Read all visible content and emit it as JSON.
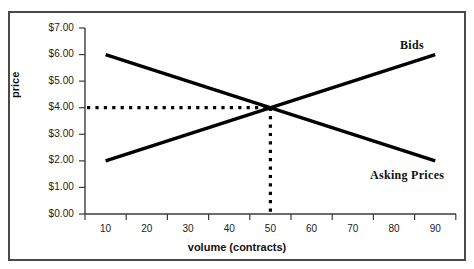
{
  "chart_data": {
    "type": "line",
    "title": "",
    "subtitle": "",
    "xlabel": "volume (contracts)",
    "ylabel": "price",
    "x": [
      10,
      20,
      30,
      40,
      50,
      60,
      70,
      80,
      90
    ],
    "xtick_labels": [
      "10",
      "20",
      "30",
      "40",
      "50",
      "60",
      "70",
      "80",
      "90"
    ],
    "ytick_labels": [
      "$7.00",
      "$6.00",
      "$5.00",
      "$4.00",
      "$3.00",
      "$2.00",
      "$1.00",
      "$0.00"
    ],
    "ytick_values": [
      7,
      6,
      5,
      4,
      3,
      2,
      1,
      0
    ],
    "ylim": [
      0,
      7
    ],
    "xlim": [
      10,
      90
    ],
    "grid": false,
    "legend_position": "inline-annotation",
    "series": [
      {
        "name": "Bids",
        "values": [
          2.0,
          2.5,
          3.0,
          3.5,
          4.0,
          4.5,
          5.0,
          5.5,
          6.0
        ],
        "color": "#000000",
        "style": "solid"
      },
      {
        "name": "Asking Prices",
        "values": [
          6.0,
          5.5,
          5.0,
          4.5,
          4.0,
          3.5,
          3.0,
          2.5,
          2.0
        ],
        "color": "#000000",
        "style": "solid"
      }
    ],
    "annotations": [
      {
        "name": "equilibrium-horizontal-guide",
        "type": "dotted-horizontal-line",
        "value": 4.0,
        "from_x": 10,
        "to_x": 50,
        "color": "#000000"
      },
      {
        "name": "equilibrium-vertical-guide",
        "type": "dotted-vertical-line",
        "value": 50,
        "from_y": 0,
        "to_y": 4.0,
        "color": "#000000"
      }
    ],
    "equilibrium_point": {
      "volume": 50,
      "price": 4.0
    }
  },
  "labels": {
    "bids": "Bids",
    "asking_prices": "Asking Prices",
    "x_axis_title": "volume (contracts)",
    "y_axis_title": "price",
    "y0": "$0.00",
    "y1": "$1.00",
    "y2": "$2.00",
    "y3": "$3.00",
    "y4": "$4.00",
    "y5": "$5.00",
    "y6": "$6.00",
    "y7": "$7.00",
    "x10": "10",
    "x20": "20",
    "x30": "30",
    "x40": "40",
    "x50": "50",
    "x60": "60",
    "x70": "70",
    "x80": "80",
    "x90": "90"
  },
  "colors": {
    "line": "#000000",
    "axis": "#3a3a3a",
    "frame": "#4a4a4a",
    "text": "#1b1b1b",
    "background": "#ffffff"
  }
}
